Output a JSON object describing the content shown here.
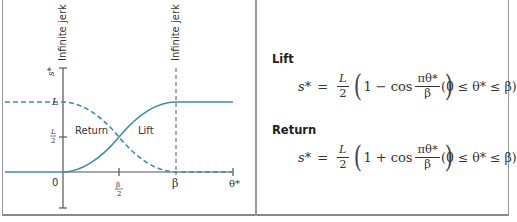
{
  "diagram": {
    "y_axis_label": "s*",
    "x_axis_label": "θ*",
    "y_ticks": {
      "L": "L",
      "L_half_num": "L",
      "L_half_den": "2"
    },
    "x_ticks": {
      "zero": "0",
      "beta_half_num": "β",
      "beta_half_den": "2",
      "beta": "β"
    },
    "annotations": {
      "jerk_left": "Infinite jerk",
      "jerk_right": "Infinite jerk",
      "return": "Return",
      "lift": "Lift"
    },
    "colors": {
      "curve": "#3f8ea6",
      "axis": "#555555",
      "jerk_line": "#555555"
    }
  },
  "equations": {
    "lift": {
      "title": "Lift",
      "lhs": "s*",
      "eq": "=",
      "coef_num": "L",
      "coef_den": "2",
      "one": "1",
      "op": "−",
      "cos": "cos",
      "arg_num": "πθ*",
      "arg_den": "β",
      "range": "(0 ≤ θ* ≤ β)"
    },
    "return": {
      "title": "Return",
      "lhs": "s*",
      "eq": "=",
      "coef_num": "L",
      "coef_den": "2",
      "one": "1",
      "op": "+",
      "cos": "cos",
      "arg_num": "πθ*",
      "arg_den": "β",
      "range": "(0 ≤ θ* ≤ β)"
    }
  }
}
